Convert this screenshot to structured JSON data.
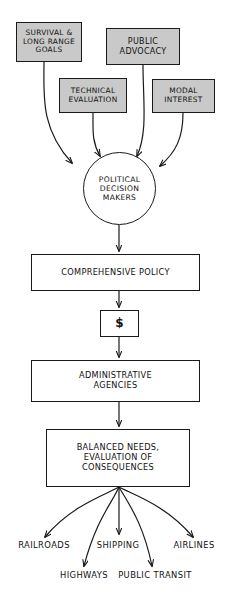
{
  "diagram": {
    "style": {
      "shaded_fill": "#c9c9c9",
      "plain_fill": "#ffffff",
      "stroke": "#1a1a1a",
      "background": "#ffffff"
    },
    "inputs": [
      {
        "id": "survival-goals",
        "label": "SURVIVAL &\nLONG RANGE\nGOALS",
        "shaded": true
      },
      {
        "id": "public-advocacy",
        "label": "PUBLIC\nADVOCACY",
        "shaded": true
      },
      {
        "id": "technical-evaluation",
        "label": "TECHNICAL\nEVALUATION",
        "shaded": true
      },
      {
        "id": "modal-interest",
        "label": "MODAL\nINTEREST",
        "shaded": true
      }
    ],
    "decision": {
      "id": "political-decision-makers",
      "label": "POLITICAL\nDECISION\nMAKERS"
    },
    "stages": [
      {
        "id": "comprehensive-policy",
        "label": "COMPREHENSIVE  POLICY"
      },
      {
        "id": "funding",
        "label": "$"
      },
      {
        "id": "administrative-agencies",
        "label": "ADMINISTRATIVE\nAGENCIES"
      },
      {
        "id": "balanced-needs",
        "label": "BALANCED  NEEDS,\nEVALUATION OF\nCONSEQUENCES"
      }
    ],
    "outcomes": [
      {
        "id": "railroads",
        "label": "RAILROADS"
      },
      {
        "id": "highways",
        "label": "HIGHWAYS"
      },
      {
        "id": "shipping",
        "label": "SHIPPING"
      },
      {
        "id": "public-transit",
        "label": "PUBLIC TRANSIT"
      },
      {
        "id": "airlines",
        "label": "AIRLINES"
      }
    ]
  }
}
